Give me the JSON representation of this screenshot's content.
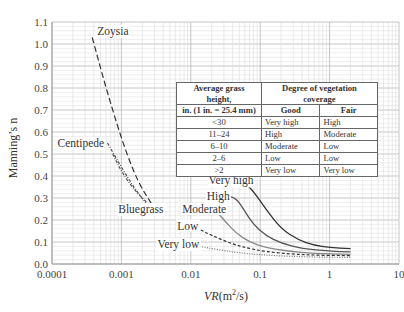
{
  "chart_data": {
    "type": "line",
    "title": "",
    "xlabel": "VR(m²/s)",
    "xlabel_parts": {
      "italic": "VR",
      "unit": "(m",
      "sup": "2",
      "tail": "/s)"
    },
    "ylabel": "Manning’s n",
    "xscale": "log",
    "xlim": [
      0.0001,
      10
    ],
    "ylim": [
      0.0,
      1.1
    ],
    "grid": true,
    "x_ticks": [
      "0.0001",
      "0.001",
      "0.01",
      "0.1",
      "1",
      "10"
    ],
    "y_ticks": [
      "0.0",
      "0.1",
      "0.2",
      "0.3",
      "0.4",
      "0.5",
      "0.6",
      "0.7",
      "0.8",
      "0.9",
      "1.0",
      "1.1"
    ],
    "series": [
      {
        "name": "Zoysia",
        "style": "long-dash",
        "color": "#333333",
        "x": [
          0.00038,
          0.0006,
          0.001,
          0.0015,
          0.002,
          0.0027
        ],
        "y": [
          1.03,
          0.8,
          0.57,
          0.42,
          0.34,
          0.275
        ]
      },
      {
        "name": "Centipede",
        "style": "dash-dot",
        "color": "#555555",
        "x": [
          0.00063,
          0.001,
          0.0015,
          0.0022,
          0.0025
        ],
        "y": [
          0.55,
          0.44,
          0.35,
          0.28,
          0.26
        ]
      },
      {
        "name": "Bluegrass",
        "style": "dash-dot",
        "color": "#555555",
        "x": [
          0.00075,
          0.001,
          0.0015,
          0.0025
        ],
        "y": [
          0.5,
          0.42,
          0.34,
          0.27
        ]
      },
      {
        "name": "Very high",
        "style": "solid",
        "color": "#333333",
        "x": [
          0.045,
          0.06,
          0.08,
          0.12,
          0.2,
          0.35,
          0.6,
          1.0,
          2.0
        ],
        "y": [
          0.38,
          0.37,
          0.33,
          0.25,
          0.16,
          0.11,
          0.085,
          0.075,
          0.07
        ]
      },
      {
        "name": "High",
        "style": "solid",
        "color": "#555555",
        "x": [
          0.032,
          0.045,
          0.06,
          0.08,
          0.12,
          0.2,
          0.4,
          1.0,
          2.0
        ],
        "y": [
          0.31,
          0.3,
          0.24,
          0.18,
          0.13,
          0.095,
          0.07,
          0.058,
          0.055
        ]
      },
      {
        "name": "Moderate",
        "style": "solid",
        "color": "#888888",
        "x": [
          0.022,
          0.03,
          0.045,
          0.07,
          0.12,
          0.25,
          0.6,
          2.0
        ],
        "y": [
          0.25,
          0.2,
          0.14,
          0.1,
          0.075,
          0.058,
          0.048,
          0.044
        ]
      },
      {
        "name": "Low",
        "style": "short-dash",
        "color": "#333333",
        "x": [
          0.012,
          0.02,
          0.04,
          0.08,
          0.2,
          0.6,
          2.0
        ],
        "y": [
          0.165,
          0.13,
          0.09,
          0.065,
          0.048,
          0.04,
          0.038
        ]
      },
      {
        "name": "Very low",
        "style": "dotted",
        "color": "#777777",
        "x": [
          0.009,
          0.02,
          0.05,
          0.15,
          0.5,
          2.0
        ],
        "y": [
          0.09,
          0.07,
          0.05,
          0.038,
          0.032,
          0.03
        ]
      }
    ],
    "annotations": [
      {
        "text": "Zoysia",
        "x": 0.00045,
        "y": 1.06
      },
      {
        "text": "Centipede",
        "x": 0.00012,
        "y": 0.55
      },
      {
        "text": "Bluegrass",
        "x": 0.0009,
        "y": 0.25
      },
      {
        "text": "Very high",
        "x": 0.018,
        "y": 0.38
      },
      {
        "text": "High",
        "x": 0.017,
        "y": 0.31
      },
      {
        "text": "Moderate",
        "x": 0.0075,
        "y": 0.25
      },
      {
        "text": "Low",
        "x": 0.0064,
        "y": 0.175
      },
      {
        "text": "Very low",
        "x": 0.0033,
        "y": 0.09
      }
    ],
    "legend_table": {
      "header_col0": "Average grass height,",
      "header_col0_sub": "in. (1 in. = 25.4 mm)",
      "header_group": "Degree of vegetation coverage",
      "header_good": "Good",
      "header_fair": "Fair",
      "rows": [
        {
          "height": "<30",
          "good": "Very high",
          "fair": "High"
        },
        {
          "height": "11–24",
          "good": "High",
          "fair": "Moderate"
        },
        {
          "height": "6–10",
          "good": "Moderate",
          "fair": "Low"
        },
        {
          "height": "2–6",
          "good": "Low",
          "fair": "Low"
        },
        {
          "height": ">2",
          "good": "Very low",
          "fair": "Very low"
        }
      ]
    }
  },
  "colors": {
    "grid_minor": "#dcdcdc",
    "grid_major": "#b8b8b8",
    "axis": "#999999",
    "text": "#333333"
  }
}
